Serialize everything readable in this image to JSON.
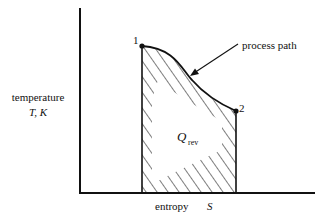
{
  "diagram": {
    "type": "T-S diagram",
    "y_axis": {
      "label_line1": "temperature",
      "label_line2": "T, K"
    },
    "x_axis": {
      "label": "entropy",
      "symbol": "S"
    },
    "points": [
      {
        "id": "1",
        "label": "1"
      },
      {
        "id": "2",
        "label": "2"
      }
    ],
    "curve_label": "process path",
    "area_label_main": "Q",
    "area_label_sub": "rev",
    "colors": {
      "ink": "#111111",
      "background": "#ffffff"
    }
  }
}
